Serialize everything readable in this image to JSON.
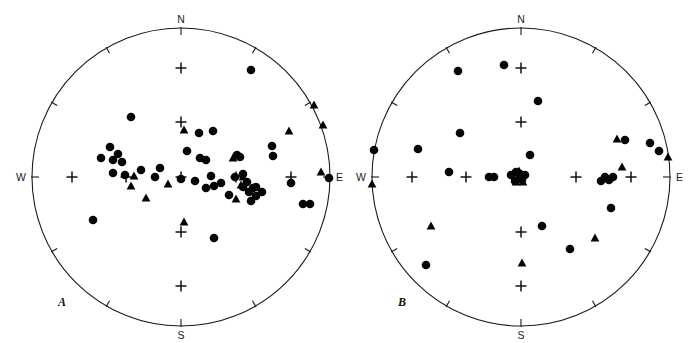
{
  "figure": {
    "type": "stereonet-pair",
    "background": "#ffffff",
    "marker_color": "#050505",
    "outline_color": "#1a1a1a"
  },
  "chart_data": {
    "type": "scatter",
    "title": "",
    "subtitle": "",
    "xlabel": "",
    "ylabel": "",
    "projection": "equal-area lower hemisphere stereonet",
    "grid": true,
    "legend_position": "none",
    "panels": [
      {
        "id": "A",
        "label": "A",
        "center_px": [
          181,
          177
        ],
        "radius_px": 149,
        "compass": {
          "north": "N",
          "south": "S",
          "east": "E",
          "west": "W"
        },
        "perimeter_tick_interval_deg": 30,
        "grid_cross_interval_deg": 30,
        "grid_crosses": [
          [
            181,
            68
          ],
          [
            181,
            122
          ],
          [
            181,
            177
          ],
          [
            181,
            232
          ],
          [
            181,
            286
          ],
          [
            72,
            177
          ],
          [
            126,
            177
          ],
          [
            236,
            177
          ],
          [
            291,
            177
          ]
        ],
        "series": [
          {
            "name": "circles",
            "marker": "filled-circle",
            "count": 44,
            "points": [
              [
                251,
                70
              ],
              [
                131,
                117
              ],
              [
                199,
                133
              ],
              [
                213,
                131
              ],
              [
                110,
                147
              ],
              [
                101,
                158
              ],
              [
                113,
                160
              ],
              [
                200,
                158
              ],
              [
                272,
                146
              ],
              [
                273,
                156
              ],
              [
                113,
                173
              ],
              [
                141,
                170
              ],
              [
                125,
                175
              ],
              [
                181,
                179
              ],
              [
                329,
                178
              ],
              [
                237,
                155
              ],
              [
                240,
                157
              ],
              [
                235,
                177
              ],
              [
                243,
                174
              ],
              [
                247,
                182
              ],
              [
                214,
                186
              ],
              [
                221,
                183
              ],
              [
                253,
                188
              ],
              [
                256,
                187
              ],
              [
                262,
                192
              ],
              [
                249,
                192
              ],
              [
                195,
                181
              ],
              [
                206,
                188
              ],
              [
                229,
                195
              ],
              [
                291,
                183
              ],
              [
                303,
                204
              ],
              [
                310,
                204
              ],
              [
                256,
                196
              ],
              [
                251,
                201
              ],
              [
                93,
                220
              ],
              [
                214,
                238
              ],
              [
                211,
                176
              ],
              [
                243,
                187
              ],
              [
                187,
                151
              ],
              [
                206,
                160
              ],
              [
                160,
                168
              ],
              [
                155,
                177
              ],
              [
                118,
                154
              ],
              [
                122,
                162
              ]
            ]
          },
          {
            "name": "triangles",
            "marker": "filled-triangle",
            "count": 14,
            "points": [
              [
                184,
                130
              ],
              [
                314,
                105
              ],
              [
                323,
                125
              ],
              [
                289,
                131
              ],
              [
                131,
                186
              ],
              [
                146,
                198
              ],
              [
                168,
                184
              ],
              [
                134,
                176
              ],
              [
                243,
                177
              ],
              [
                233,
                158
              ],
              [
                241,
                185
              ],
              [
                236,
                199
              ],
              [
                321,
                172
              ],
              [
                184,
                222
              ]
            ]
          }
        ]
      },
      {
        "id": "B",
        "label": "B",
        "center_px": [
          521,
          177
        ],
        "radius_px": 149,
        "compass": {
          "north": "N",
          "south": "S",
          "east": "E",
          "west": "W"
        },
        "perimeter_tick_interval_deg": 30,
        "grid_cross_interval_deg": 30,
        "grid_crosses": [
          [
            521,
            68
          ],
          [
            521,
            122
          ],
          [
            521,
            177
          ],
          [
            521,
            232
          ],
          [
            521,
            286
          ],
          [
            412,
            177
          ],
          [
            466,
            177
          ],
          [
            576,
            177
          ],
          [
            631,
            177
          ]
        ],
        "series": [
          {
            "name": "circles",
            "marker": "filled-circle",
            "count": 28,
            "points": [
              [
                504,
                65
              ],
              [
                458,
                71
              ],
              [
                538,
                101
              ],
              [
                460,
                133
              ],
              [
                418,
                149
              ],
              [
                374,
                150
              ],
              [
                625,
                140
              ],
              [
                650,
                143
              ],
              [
                659,
                151
              ],
              [
                530,
                155
              ],
              [
                449,
                172
              ],
              [
                489,
                177
              ],
              [
                494,
                177
              ],
              [
                516,
                172
              ],
              [
                520,
                176
              ],
              [
                525,
                175
              ],
              [
                515,
                181
              ],
              [
                601,
                181
              ],
              [
                609,
                180
              ],
              [
                613,
                177
              ],
              [
                611,
                208
              ],
              [
                542,
                226
              ],
              [
                570,
                249
              ],
              [
                426,
                265
              ],
              [
                520,
                174
              ],
              [
                511,
                175
              ],
              [
                605,
                177
              ],
              [
                522,
                180
              ]
            ]
          },
          {
            "name": "triangles",
            "marker": "filled-triangle",
            "count": 11,
            "points": [
              [
                617,
                139
              ],
              [
                622,
                167
              ],
              [
                668,
                157
              ],
              [
                372,
                184
              ],
              [
                519,
                171
              ],
              [
                516,
                182
              ],
              [
                523,
                182
              ],
              [
                431,
                226
              ],
              [
                595,
                238
              ],
              [
                522,
                263
              ],
              [
                520,
                177
              ]
            ]
          }
        ]
      }
    ]
  }
}
